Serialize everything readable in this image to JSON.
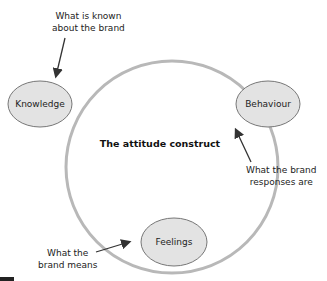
{
  "diagram": {
    "title": "The attitude construct",
    "nodes": [
      {
        "id": "knowledge",
        "label": "Knowledge"
      },
      {
        "id": "behaviour",
        "label": "Behaviour"
      },
      {
        "id": "feelings",
        "label": "Feelings"
      }
    ],
    "annotations": {
      "knowledge": [
        "What is known",
        "about the brand"
      ],
      "behaviour": [
        "What the brand",
        "responses are"
      ],
      "feelings": [
        "What the",
        "brand means"
      ]
    },
    "colors": {
      "circle": "#b8b8b8",
      "node_fill": "#e3e3e3",
      "node_stroke": "#777777",
      "arrow": "#333333"
    }
  }
}
